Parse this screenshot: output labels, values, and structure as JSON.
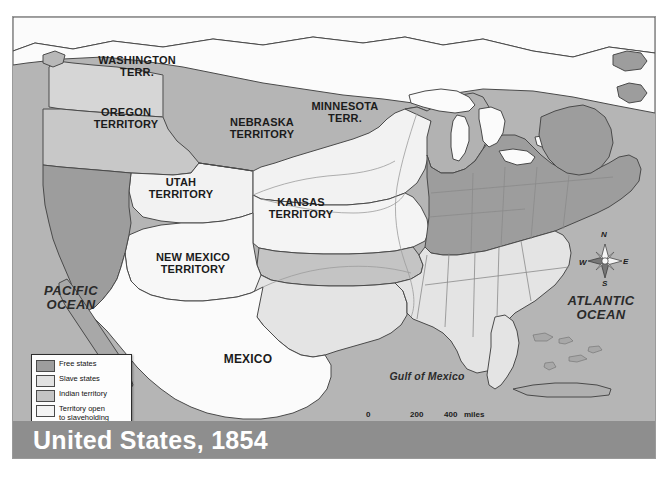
{
  "map": {
    "title": "United States, 1854",
    "frame_present": true,
    "colors": {
      "free_states": "#9d9d9d",
      "slave_states": "#e2e2e2",
      "indian_territory": "#c4c4c4",
      "territory_open": "#f4f4f4",
      "territory_closed": "#b0b0b0",
      "ocean": "#b5b5b5",
      "foreign_land": "#ffffff",
      "title_band": "#8e8e8e",
      "border_line": "#4a4a4a"
    },
    "region_labels": [
      {
        "id": "washington-territory",
        "text": "WASHINGTON\nTERR."
      },
      {
        "id": "oregon-territory",
        "text": "OREGON\nTERRITORY"
      },
      {
        "id": "utah-territory",
        "text": "UTAH\nTERRITORY"
      },
      {
        "id": "new-mexico-territory",
        "text": "NEW MEXICO\nTERRITORY"
      },
      {
        "id": "nebraska-territory",
        "text": "NEBRASKA\nTERRITORY"
      },
      {
        "id": "kansas-territory",
        "text": "KANSAS\nTERRITORY"
      },
      {
        "id": "minnesota-territory",
        "text": "MINNESOTA\nTERR."
      },
      {
        "id": "mexico",
        "text": "MEXICO"
      }
    ],
    "water_labels": [
      {
        "id": "pacific-ocean",
        "text": "PACIFIC\nOCEAN"
      },
      {
        "id": "atlantic-ocean",
        "text": "ATLANTIC\nOCEAN"
      },
      {
        "id": "gulf-of-mexico",
        "text": "Gulf of Mexico"
      }
    ],
    "legend": {
      "items": [
        {
          "label": "Free states",
          "swatch": "#9d9d9d"
        },
        {
          "label": "Slave states",
          "swatch": "#e2e2e2"
        },
        {
          "label": "Indian territory",
          "swatch": "#c4c4c4"
        },
        {
          "label": "Territory open\nto slaveholding",
          "swatch": "#f4f4f4"
        },
        {
          "label": "Territory closed\nto slaveholding",
          "swatch": "#b0b0b0"
        }
      ]
    },
    "scale_bar": {
      "miles": {
        "ticks": [
          "0",
          "200",
          "400"
        ],
        "unit": "miles"
      },
      "kilometers": {
        "ticks": [
          "0",
          "200",
          "400"
        ],
        "unit": "kilometers"
      }
    },
    "compass": {
      "north": "N",
      "east": "E",
      "south": "S",
      "west": "W"
    }
  }
}
